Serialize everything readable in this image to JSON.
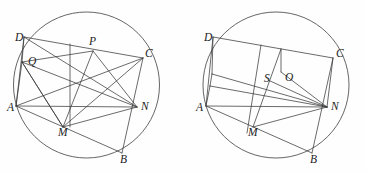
{
  "figure": {
    "type": "geometry-diagram",
    "background_color": "#fefefe",
    "stroke_color": "#3a3a3a",
    "panels": [
      {
        "id": "left-panel",
        "name": "left-figure",
        "circle": {
          "cx": 86.5,
          "cy": 85,
          "r": 73
        },
        "labels": [
          {
            "key": "D",
            "text": "D",
            "x": 15,
            "y": 41
          },
          {
            "key": "P",
            "text": "P",
            "x": 89,
            "y": 45
          },
          {
            "key": "C",
            "text": "C",
            "x": 145,
            "y": 57
          },
          {
            "key": "Q",
            "text": "Q",
            "x": 28,
            "y": 65
          },
          {
            "key": "A",
            "text": "A",
            "x": 7,
            "y": 111
          },
          {
            "key": "N",
            "text": "N",
            "x": 141,
            "y": 110
          },
          {
            "key": "M",
            "text": "M",
            "x": 58,
            "y": 136
          },
          {
            "key": "B",
            "text": "B",
            "x": 120,
            "y": 163
          }
        ],
        "points": {
          "D": [
            24,
            37
          ],
          "P": [
            93,
            51
          ],
          "C": [
            143,
            58
          ],
          "Q": [
            22,
            62
          ],
          "A": [
            16,
            106
          ],
          "N": [
            137,
            107
          ],
          "M": [
            63,
            127
          ],
          "B": [
            122,
            153
          ],
          "X": [
            70,
            97
          ]
        },
        "segments": [
          [
            "D",
            "C"
          ],
          [
            "D",
            "A"
          ],
          [
            "A",
            "B"
          ],
          [
            "B",
            "C"
          ],
          [
            "D",
            "N"
          ],
          [
            "A",
            "C"
          ],
          [
            "Q",
            "P"
          ],
          [
            "Q",
            "N"
          ],
          [
            "Q",
            "M"
          ],
          [
            "P",
            "M"
          ],
          [
            "P",
            "N"
          ],
          [
            "M",
            "N"
          ],
          [
            "M",
            "C"
          ],
          [
            "A",
            "N"
          ],
          [
            "Q",
            "A"
          ],
          [
            "D",
            "Q"
          ],
          [
            "P",
            "X"
          ],
          [
            "X",
            "M"
          ]
        ]
      },
      {
        "id": "right-panel",
        "name": "right-figure",
        "circle": {
          "cx": 276,
          "cy": 85,
          "r": 73
        },
        "labels": [
          {
            "key": "D",
            "text": "D",
            "x": 204,
            "y": 41
          },
          {
            "key": "C",
            "text": "C",
            "x": 336,
            "y": 57
          },
          {
            "key": "S",
            "text": "S",
            "x": 264,
            "y": 82
          },
          {
            "key": "O",
            "text": "O",
            "x": 285,
            "y": 81
          },
          {
            "key": "A",
            "text": "A",
            "x": 196,
            "y": 111
          },
          {
            "key": "N",
            "text": "N",
            "x": 331,
            "y": 110
          },
          {
            "key": "M",
            "text": "M",
            "x": 248,
            "y": 136
          },
          {
            "key": "B",
            "text": "B",
            "x": 310,
            "y": 163
          }
        ],
        "points": {
          "D": [
            213,
            37
          ],
          "C": [
            333,
            58
          ],
          "S": [
            268,
            75
          ],
          "O": [
            281,
            71
          ],
          "A": [
            206,
            106
          ],
          "N": [
            327,
            107
          ],
          "M": [
            253,
            127
          ],
          "B": [
            312,
            153
          ],
          "T": [
            212,
            74
          ],
          "U": [
            210,
            86
          ],
          "V": [
            261,
            45
          ],
          "W": [
            247,
            133
          ]
        },
        "segments": [
          [
            "D",
            "C"
          ],
          [
            "D",
            "A"
          ],
          [
            "A",
            "B"
          ],
          [
            "B",
            "C"
          ],
          [
            "C",
            "N"
          ],
          [
            "A",
            "N"
          ],
          [
            "D",
            "T"
          ],
          [
            "T",
            "U"
          ],
          [
            "U",
            "A"
          ],
          [
            "T",
            "N"
          ],
          [
            "U",
            "N"
          ],
          [
            "O",
            "N"
          ],
          [
            "S",
            "N"
          ],
          [
            "O",
            "S"
          ],
          [
            "V",
            "W"
          ],
          [
            "O",
            "M"
          ],
          [
            "M",
            "B"
          ],
          [
            "A",
            "M"
          ],
          [
            "M",
            "N"
          ]
        ]
      }
    ]
  }
}
